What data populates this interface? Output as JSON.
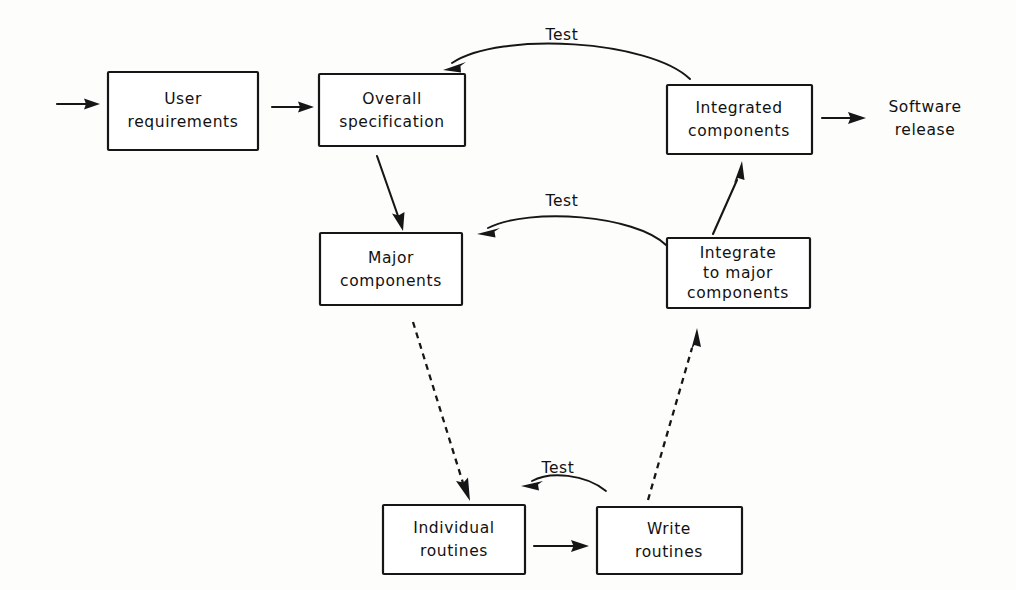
{
  "diagram": {
    "style": "hand-drawn monospace flowchart, black on white",
    "colors": {
      "stroke": "#161616",
      "background": "#fdfdfc",
      "box_fill": "#ffffff",
      "text": "#111111"
    },
    "nodes": [
      {
        "id": "user-requirements",
        "lines": [
          "User",
          "requirements"
        ],
        "line1": "User",
        "line2": "requirements",
        "x": 108,
        "y": 72,
        "w": 150,
        "h": 78
      },
      {
        "id": "overall-specification",
        "lines": [
          "Overall",
          "specification"
        ],
        "line1": "Overall",
        "line2": "specification",
        "x": 319,
        "y": 74,
        "w": 146,
        "h": 72
      },
      {
        "id": "integrated-components",
        "lines": [
          "Integrated",
          "components"
        ],
        "line1": "Integrated",
        "line2": "components",
        "x": 667,
        "y": 85,
        "w": 145,
        "h": 69
      },
      {
        "id": "major-components",
        "lines": [
          "Major",
          "components"
        ],
        "line1": "Major",
        "line2": "components",
        "x": 320,
        "y": 233,
        "w": 142,
        "h": 72
      },
      {
        "id": "integrate-to-major-components",
        "lines": [
          "Integrate",
          "to major",
          "components"
        ],
        "line1": "Integrate",
        "line2": "to major",
        "line3": "components",
        "x": 667,
        "y": 238,
        "w": 143,
        "h": 70
      },
      {
        "id": "individual-routines",
        "lines": [
          "Individual",
          "routines"
        ],
        "line1": "Individual",
        "line2": "routines",
        "x": 383,
        "y": 505,
        "w": 142,
        "h": 69
      },
      {
        "id": "write-routines",
        "lines": [
          "Write",
          "routines"
        ],
        "line1": "Write",
        "line2": "routines",
        "x": 597,
        "y": 507,
        "w": 145,
        "h": 67
      }
    ],
    "free_labels": [
      {
        "id": "software-release",
        "lines": [
          "Software",
          "release"
        ],
        "line1": "Software",
        "line2": "release",
        "x": 925,
        "y": 106
      }
    ],
    "edge_labels": [
      {
        "id": "test-top",
        "text": "Test",
        "x": 562,
        "y": 40
      },
      {
        "id": "test-middle",
        "text": "Test",
        "x": 562,
        "y": 206
      },
      {
        "id": "test-bottom",
        "text": "Test",
        "x": 558,
        "y": 473
      }
    ],
    "edges": [
      {
        "id": "input-to-user-requirements",
        "from": "external-input",
        "to": "user-requirements",
        "type": "solid-straight"
      },
      {
        "id": "user-requirements-to-overall-specification",
        "from": "user-requirements",
        "to": "overall-specification",
        "type": "solid-straight"
      },
      {
        "id": "overall-specification-to-major-components",
        "from": "overall-specification",
        "to": "major-components",
        "type": "solid-straight"
      },
      {
        "id": "major-components-to-individual-routines",
        "from": "major-components",
        "to": "individual-routines",
        "type": "dashed"
      },
      {
        "id": "individual-routines-to-write-routines",
        "from": "individual-routines",
        "to": "write-routines",
        "type": "solid-straight"
      },
      {
        "id": "write-routines-to-integrate-to-major-components",
        "from": "write-routines",
        "to": "integrate-to-major-components",
        "type": "dashed"
      },
      {
        "id": "integrate-to-major-components-to-integrated-components",
        "from": "integrate-to-major-components",
        "to": "integrated-components",
        "type": "solid-straight"
      },
      {
        "id": "integrated-components-to-software-release",
        "from": "integrated-components",
        "to": "software-release",
        "type": "solid-straight"
      },
      {
        "id": "test-arc-bottom",
        "from": "write-routines",
        "to": "individual-routines",
        "type": "arc",
        "label": "Test"
      },
      {
        "id": "test-arc-middle",
        "from": "integrate-to-major-components",
        "to": "major-components",
        "type": "arc",
        "label": "Test"
      },
      {
        "id": "test-arc-top",
        "from": "integrated-components",
        "to": "overall-specification",
        "type": "arc",
        "label": "Test"
      }
    ]
  }
}
